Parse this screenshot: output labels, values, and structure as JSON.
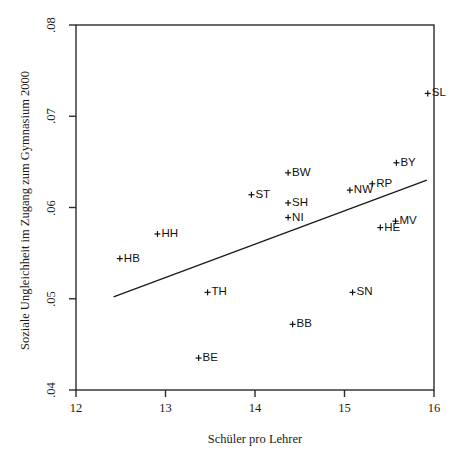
{
  "chart_data": {
    "type": "scatter",
    "title": "",
    "xlabel": "Schüler pro Lehrer",
    "ylabel": "Soziale Ungleichheit im Zugang zum Gymnasium 2000",
    "xlim": [
      11.6,
      16.1
    ],
    "ylim": [
      0.0385,
      0.0805
    ],
    "xticks": [
      12,
      13,
      14,
      15,
      16
    ],
    "xtick_labels": [
      "12",
      "13",
      "14",
      "15",
      "16"
    ],
    "yticks": [
      0.04,
      0.05,
      0.06,
      0.07,
      0.08
    ],
    "ytick_labels": [
      ".04",
      ".05",
      ".06",
      ".07",
      ".08"
    ],
    "grid": false,
    "legend": null,
    "marker": "+",
    "points": [
      {
        "label": "SL",
        "x": 15.93,
        "y": 0.0725
      },
      {
        "label": "BY",
        "x": 15.58,
        "y": 0.0649
      },
      {
        "label": "BW",
        "x": 14.37,
        "y": 0.0638
      },
      {
        "label": "RP",
        "x": 15.31,
        "y": 0.0626
      },
      {
        "label": "NW",
        "x": 15.06,
        "y": 0.0619
      },
      {
        "label": "ST",
        "x": 13.96,
        "y": 0.0614
      },
      {
        "label": "SH",
        "x": 14.37,
        "y": 0.0605
      },
      {
        "label": "NI",
        "x": 14.37,
        "y": 0.0589
      },
      {
        "label": "MV",
        "x": 15.57,
        "y": 0.0585
      },
      {
        "label": "HH",
        "x": 12.91,
        "y": 0.0571
      },
      {
        "label": "HE",
        "x": 15.4,
        "y": 0.0578
      },
      {
        "label": "HB",
        "x": 12.49,
        "y": 0.0544
      },
      {
        "label": "TH",
        "x": 13.47,
        "y": 0.0507
      },
      {
        "label": "SN",
        "x": 15.09,
        "y": 0.0507
      },
      {
        "label": "BB",
        "x": 14.42,
        "y": 0.0472
      },
      {
        "label": "BE",
        "x": 13.37,
        "y": 0.0435
      }
    ],
    "fit_line": {
      "type": "linear-regression",
      "x_start": 12.42,
      "y_start": 0.0502,
      "x_end": 15.92,
      "y_end": 0.063
    }
  },
  "axes": {
    "frame_color": "#2b2b2b",
    "tick_color": "#2b2b2b"
  }
}
